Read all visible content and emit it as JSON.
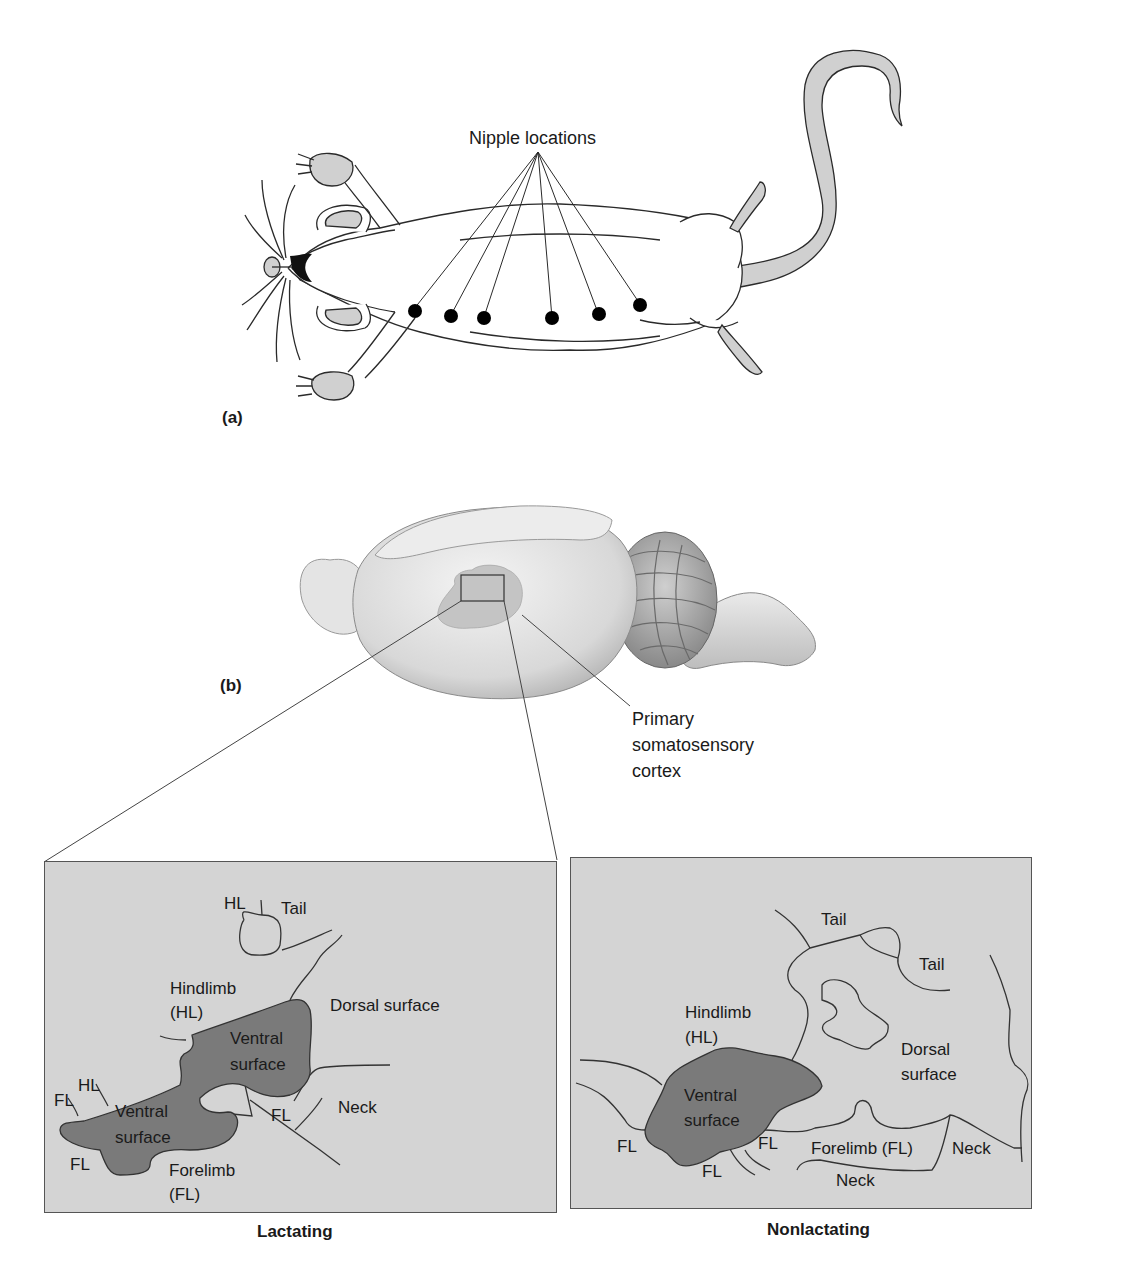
{
  "figure": {
    "panel_a": {
      "label": "(a)",
      "callout": "Nipple locations",
      "nipple_count": 6
    },
    "panel_b": {
      "label": "(b)",
      "callout": "Primary\nsomatosensory\ncortex"
    },
    "maps": [
      {
        "caption": "Lactating",
        "labels": {
          "hl_top": "HL",
          "tail": "Tail",
          "hindlimb": "Hindlimb\n(HL)",
          "dorsal": "Dorsal surface",
          "ventral_upper": "Ventral\nsurface",
          "ventral_lower": "Ventral\nsurface",
          "hl_left": "HL",
          "fl_left": "FL",
          "fl_mid": "FL",
          "neck": "Neck",
          "fl_bottom": "FL",
          "forelimb": "Forelimb\n(FL)"
        }
      },
      {
        "caption": "Nonlactating",
        "labels": {
          "tail_1": "Tail",
          "tail_2": "Tail",
          "hindlimb": "Hindlimb\n(HL)",
          "dorsal": "Dorsal\nsurface",
          "ventral": "Ventral\nsurface",
          "fl_left": "FL",
          "fl_mid": "FL",
          "fl_bottom": "FL",
          "forelimb": "Forelimb (FL)",
          "neck_right": "Neck",
          "neck_bottom": "Neck"
        }
      }
    ],
    "colors": {
      "panel_bg": "#d4d4d4",
      "ventral_fill": "#7a7a7a",
      "paw_fill": "#cfcfcf",
      "outline": "#2a2a2a"
    }
  }
}
